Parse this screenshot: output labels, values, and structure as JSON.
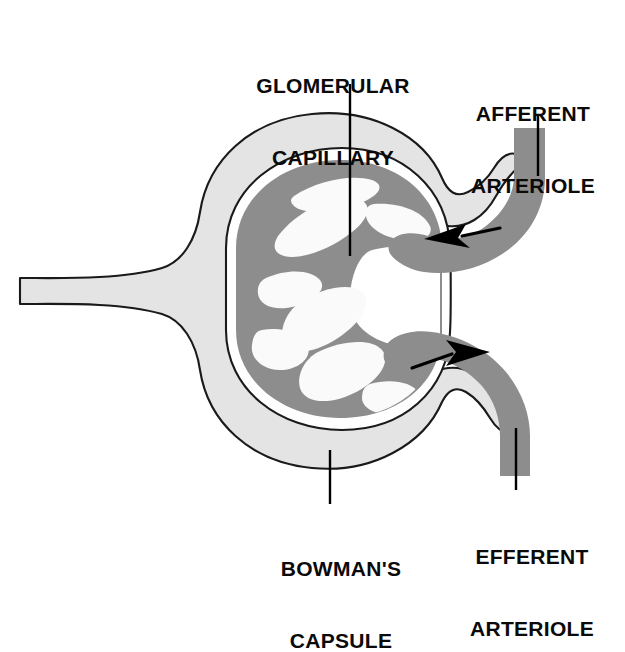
{
  "figure": {
    "background_color": "#ffffff"
  },
  "labels": {
    "glomerular_capillary": {
      "line1": "GLOMERULAR",
      "line2": "CAPILLARY",
      "text": "GLOMERULAR\nCAPILLARY"
    },
    "afferent_arteriole": {
      "line1": "AFFERENT",
      "line2": "ARTERIOLE",
      "text": "AFFERENT\nARTERIOLE"
    },
    "bowmans_capsule": {
      "line1": "BOWMAN'S",
      "line2": "CAPSULE",
      "text": "BOWMAN'S\nCAPSULE"
    },
    "efferent_arteriole": {
      "line1": "EFFERENT",
      "line2": "ARTERIOLE",
      "text": "EFFERENT\nARTERIOLE"
    }
  },
  "colors": {
    "capsule_fill": "#e4e4e4",
    "capillary_fill": "#8d8d8d",
    "arteriole_fill": "#8d8d8d",
    "outline": "#1a1a1a",
    "arrow": "#000000",
    "leader_line": "#000000",
    "lumen_white": "#ffffff",
    "text": "#0a0a0a"
  },
  "structures": {
    "bowmans_capsule": {
      "name": "Bowman's capsule",
      "description": "Light gray cup-shaped capsule with outlined border surrounding the glomerulus, opening to proximal tubule on the left",
      "fill": "#e4e4e4"
    },
    "glomerular_capillary": {
      "name": "Glomerular capillary tuft",
      "description": "Dark gray coiled capillary loops inside the capsular space",
      "fill": "#8d8d8d"
    },
    "afferent_arteriole": {
      "name": "Afferent arteriole",
      "description": "Dark gray vessel entering the glomerulus from upper right",
      "flow_direction": "inward",
      "arrow": "left-pointing"
    },
    "efferent_arteriole": {
      "name": "Efferent arteriole",
      "description": "Dark gray vessel leaving the glomerulus toward lower right",
      "flow_direction": "outward",
      "arrow": "right-pointing"
    },
    "proximal_tubule": {
      "name": "Tubule neck",
      "description": "Light gray band extending to the left edge from the capsule"
    }
  },
  "leader_lines": [
    {
      "name": "glomerular-capillary-leader",
      "from": "label",
      "to": "glomerular capillary tuft"
    },
    {
      "name": "afferent-arteriole-leader",
      "from": "label",
      "to": "afferent arteriole"
    },
    {
      "name": "bowmans-capsule-leader",
      "from": "label",
      "to": "bowman's capsule wall"
    },
    {
      "name": "efferent-arteriole-leader",
      "from": "label",
      "to": "efferent arteriole"
    }
  ]
}
